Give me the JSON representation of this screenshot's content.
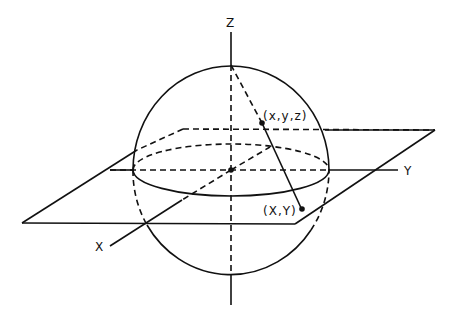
{
  "diagram": {
    "labels": {
      "z_axis": "Z",
      "y_axis": "Y",
      "x_axis": "X",
      "sphere_point": "(x,y,z)",
      "plane_point": "(X,Y)"
    },
    "colors": {
      "ink": "#111111",
      "background": "#ffffff"
    }
  }
}
